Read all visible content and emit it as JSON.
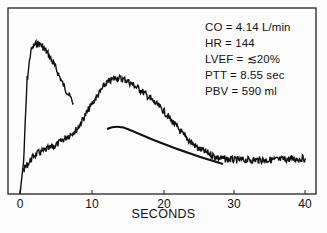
{
  "chart_data": {
    "type": "line",
    "title": "",
    "xlabel": "SECONDS",
    "ylabel": "",
    "xlim": [
      0,
      40
    ],
    "x_ticks": [
      "0",
      "10",
      "20",
      "30",
      "40"
    ],
    "grid": false,
    "legend": null,
    "annotations": [
      "CO = 4.14 L/min",
      "HR = 144",
      "LVEF = ≲20%",
      "PTT = 8.55 sec",
      "PBV = 590 ml"
    ],
    "series": [
      {
        "name": "first-pass curve (noisy, early)",
        "x": [
          0,
          0.5,
          1.0,
          1.5,
          2.0,
          2.5,
          3.0,
          4.0,
          5.0,
          6.0,
          7.0,
          7.5
        ],
        "y": [
          0,
          20,
          70,
          88,
          92,
          93,
          92,
          86,
          78,
          68,
          60,
          56
        ]
      },
      {
        "name": "recirculation curve (noisy)",
        "x": [
          0.5,
          2,
          5,
          8,
          10,
          12,
          13.5,
          15,
          17,
          20,
          23,
          25,
          28,
          30,
          35,
          40
        ],
        "y": [
          15,
          24,
          30,
          40,
          55,
          68,
          72,
          70,
          64,
          52,
          36,
          28,
          22,
          21,
          21,
          22
        ]
      },
      {
        "name": "fitted smooth curve",
        "x": [
          12.5,
          13.5,
          15,
          18,
          21,
          24,
          27,
          28.5
        ],
        "y": [
          40,
          41,
          40,
          36,
          30,
          24,
          19,
          17
        ]
      }
    ]
  },
  "labels": {
    "co": "CO = 4.14 L/min",
    "hr": "HR = 144",
    "lvef": "LVEF = ≲20%",
    "ptt": "PTT = 8.55 sec",
    "pbv": "PBV = 590 ml",
    "xlabel": "SECONDS",
    "ticks": [
      "0",
      "10",
      "20",
      "30",
      "40"
    ]
  }
}
